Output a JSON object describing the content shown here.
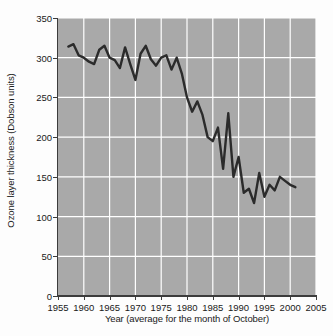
{
  "chart_data": {
    "type": "line",
    "title": "",
    "xlabel": "Year (average for the month of October)",
    "ylabel": "Ozone layer thickness (Dobson units)",
    "xlim": [
      1955,
      2005
    ],
    "ylim": [
      0,
      350
    ],
    "xticks": [
      1955,
      1960,
      1965,
      1970,
      1975,
      1980,
      1985,
      1990,
      1995,
      2000,
      2005
    ],
    "yticks": [
      0,
      50,
      100,
      150,
      200,
      250,
      300,
      350
    ],
    "grid": true,
    "grid_color": "#ffffff",
    "plot_bgcolor": "#a9a9a9",
    "line_color": "#2b2b2b",
    "legend": null,
    "series": [
      {
        "name": "Ozone layer thickness (October average)",
        "x": [
          1957,
          1958,
          1959,
          1960,
          1961,
          1962,
          1963,
          1964,
          1965,
          1966,
          1967,
          1968,
          1969,
          1970,
          1971,
          1972,
          1973,
          1974,
          1975,
          1976,
          1977,
          1978,
          1979,
          1980,
          1981,
          1982,
          1983,
          1984,
          1985,
          1986,
          1987,
          1988,
          1989,
          1990,
          1991,
          1992,
          1993,
          1994,
          1995,
          1996,
          1997,
          1998,
          1999,
          2000,
          2001
        ],
        "values": [
          314,
          317,
          303,
          300,
          295,
          292,
          310,
          315,
          300,
          297,
          287,
          313,
          292,
          272,
          305,
          315,
          298,
          290,
          300,
          303,
          285,
          300,
          280,
          250,
          232,
          245,
          228,
          200,
          195,
          212,
          160,
          230,
          150,
          175,
          130,
          135,
          117,
          155,
          125,
          140,
          133,
          150,
          145,
          140,
          137
        ]
      }
    ]
  }
}
